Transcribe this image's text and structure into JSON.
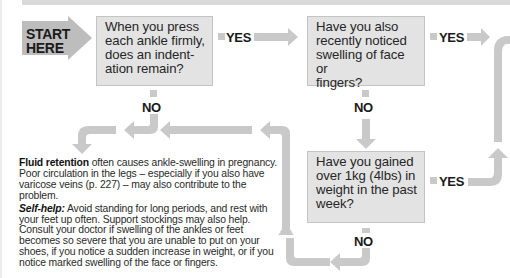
{
  "flowchart": {
    "start": {
      "label": "START\nHERE"
    },
    "questions": [
      {
        "id": "q1",
        "text": "When you press\neach ankle firmly,\ndoes an indent-\nation remain?"
      },
      {
        "id": "q2",
        "text": "Have you also\nrecently noticed\nswelling of face or\nfingers?"
      },
      {
        "id": "q3",
        "text": "Have you gained\nover 1kg (4lbs) in\nweight in the past\nweek?"
      }
    ],
    "branch_labels": {
      "q1_yes": "YES",
      "q1_no": "NO",
      "q2_yes": "YES",
      "q2_no": "NO",
      "q3_yes": "YES",
      "q3_no": "NO"
    }
  },
  "outcome": {
    "p1_heading": "Fluid retention",
    "p1_body": " often causes ankle-swelling in pregnancy. Poor circulation in the legs – especially if you also have varicose veins (p. 227) – may also contribute to the problem.",
    "p2_heading": "Self-help:",
    "p2_body": " Avoid standing for long periods, and rest with your feet up often. Support stockings may also help. Consult your doctor if swelling of the ankles or feet becomes so severe that you are unable to put on your shoes, if you notice a sudden increase in weight, or if you notice marked swelling of the face or fingers."
  },
  "colors": {
    "arrow": "#c9c9c9",
    "start_arrow": "#bdbdbd",
    "box_fill": "#e3e3e3",
    "box_border": "#c4c4c4"
  }
}
